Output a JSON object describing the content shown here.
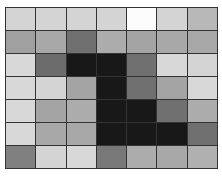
{
  "grid": {
    "rows": 7,
    "cols": 7,
    "line_color": "#333333",
    "cells": [
      [
        "#d4d4d4",
        "#d4d4d4",
        "#d4d4d4",
        "#d4d4d4",
        "#fcfcfc",
        "#d4d4d4",
        "#b8b8b8"
      ],
      [
        "#a0a0a0",
        "#a8a8a8",
        "#707070",
        "#acacac",
        "#a4a4a4",
        "#a8a8a8",
        "#a8a8a8"
      ],
      [
        "#d8d8d8",
        "#6c6c6c",
        "#181818",
        "#181818",
        "#707070",
        "#d8d8d8",
        "#d4d4d4"
      ],
      [
        "#d8d8d8",
        "#d4d4d4",
        "#a4a4a4",
        "#181818",
        "#707070",
        "#a4a4a4",
        "#d8d8d8"
      ],
      [
        "#d8d8d8",
        "#a4a4a4",
        "#acacac",
        "#181818",
        "#181818",
        "#707070",
        "#acacac"
      ],
      [
        "#d8d8d8",
        "#a8a8a8",
        "#a8a8a8",
        "#181818",
        "#181818",
        "#181818",
        "#707070"
      ],
      [
        "#808080",
        "#d4d4d4",
        "#d8d8d8",
        "#787878",
        "#acacac",
        "#a8a8a8",
        "#b0b0b0"
      ]
    ]
  }
}
